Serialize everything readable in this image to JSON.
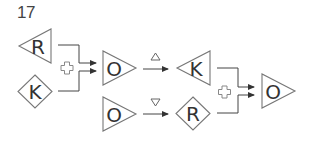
{
  "puzzle": {
    "number": "17",
    "top_left_group": {
      "inputs": [
        {
          "shape": "left-triangle",
          "letter": "R"
        },
        {
          "shape": "diamond",
          "letter": "K"
        }
      ],
      "operator": "plus-icon",
      "output": {
        "shape": "right-triangle",
        "letter": "O"
      }
    },
    "transforms": [
      {
        "from": {
          "shape": "right-triangle",
          "letter": "O"
        },
        "marker": "up-triangle-icon",
        "to": {
          "shape": "left-triangle",
          "letter": "K"
        }
      },
      {
        "from": {
          "shape": "right-triangle",
          "letter": "O"
        },
        "marker": "down-triangle-icon",
        "to": {
          "shape": "diamond",
          "letter": "R"
        }
      }
    ],
    "right_group": {
      "inputs": [
        {
          "shape": "left-triangle",
          "letter": "K"
        },
        {
          "shape": "diamond",
          "letter": "R"
        }
      ],
      "operator": "plus-icon",
      "output": {
        "shape": "right-triangle",
        "letter": "O"
      }
    }
  }
}
